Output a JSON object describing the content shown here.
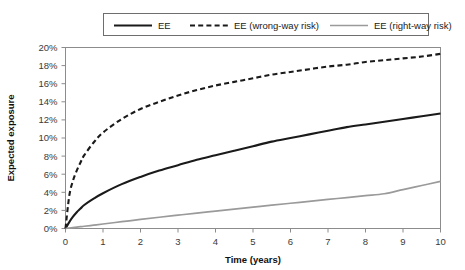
{
  "chart_data": {
    "type": "line",
    "title": "",
    "xlabel": "Time (years)",
    "ylabel": "Expected exposure",
    "xlim": [
      0,
      10
    ],
    "ylim": [
      0,
      20
    ],
    "grid": false,
    "legend_position": "top",
    "x_ticks": [
      "0",
      "1",
      "2",
      "3",
      "4",
      "5",
      "6",
      "7",
      "8",
      "9",
      "10"
    ],
    "y_ticks": [
      "0%",
      "2%",
      "4%",
      "6%",
      "8%",
      "10%",
      "12%",
      "14%",
      "16%",
      "18%",
      "20%"
    ],
    "x": [
      0,
      0.1,
      0.2,
      0.3,
      0.4,
      0.5,
      0.75,
      1,
      1.5,
      2,
      2.5,
      3,
      3.5,
      4,
      4.5,
      5,
      5.5,
      6,
      6.5,
      7,
      7.5,
      8,
      8.5,
      9,
      9.5,
      10
    ],
    "series": [
      {
        "name": "EE",
        "style": "solid",
        "color": "#1a1a1a",
        "width": 2.1,
        "values": [
          0.0,
          0.7,
          1.3,
          1.8,
          2.2,
          2.6,
          3.3,
          3.9,
          4.9,
          5.7,
          6.4,
          7.0,
          7.6,
          8.1,
          8.6,
          9.1,
          9.6,
          10.0,
          10.4,
          10.8,
          11.2,
          11.5,
          11.8,
          12.1,
          12.4,
          12.7
        ]
      },
      {
        "name": "EE (wrong-way risk)",
        "style": "dashed",
        "color": "#1a1a1a",
        "width": 2.1,
        "values": [
          0.0,
          3.6,
          5.3,
          6.4,
          7.3,
          8.1,
          9.5,
          10.6,
          12.1,
          13.2,
          14.0,
          14.7,
          15.3,
          15.8,
          16.2,
          16.6,
          17.0,
          17.3,
          17.6,
          17.9,
          18.1,
          18.4,
          18.6,
          18.8,
          19.0,
          19.3
        ]
      },
      {
        "name": "EE (right-way risk)",
        "style": "solid",
        "color": "#9a9a9a",
        "width": 1.7,
        "values": [
          0.0,
          0.05,
          0.1,
          0.15,
          0.2,
          0.25,
          0.37,
          0.5,
          0.75,
          1.0,
          1.24,
          1.47,
          1.7,
          1.92,
          2.14,
          2.36,
          2.58,
          2.79,
          3.0,
          3.21,
          3.42,
          3.63,
          3.84,
          4.3,
          4.75,
          5.2
        ]
      }
    ]
  },
  "legend": {
    "items": [
      {
        "label": "EE",
        "style": "solid",
        "color": "#1a1a1a"
      },
      {
        "label": "EE (wrong-way risk)",
        "style": "dashed",
        "color": "#1a1a1a"
      },
      {
        "label": "EE (right-way risk)",
        "style": "solid",
        "color": "#9a9a9a"
      }
    ]
  }
}
